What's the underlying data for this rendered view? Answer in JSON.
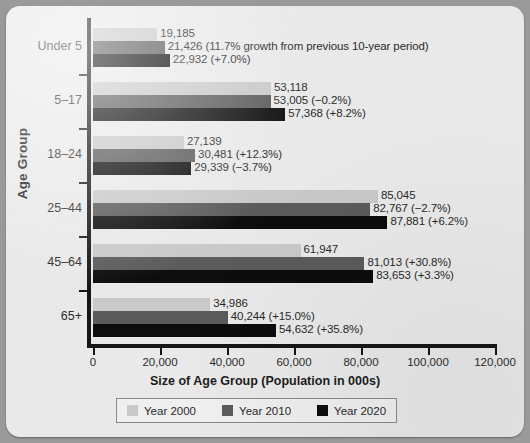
{
  "chart_data": {
    "type": "bar",
    "orientation": "horizontal",
    "title": "",
    "xlabel": "Size of Age Group (Population in 000s)",
    "ylabel": "Age Group",
    "xlim": [
      0,
      120000
    ],
    "xticks": [
      0,
      20000,
      40000,
      60000,
      80000,
      100000,
      120000
    ],
    "xticklabels": [
      "0",
      "20,000",
      "40,000",
      "60,000",
      "80,000",
      "100,000",
      "120,000"
    ],
    "grid": false,
    "legend_position": "bottom",
    "categories": [
      "Under 5",
      "5–17",
      "18–24",
      "25–44",
      "45–64",
      "65+"
    ],
    "series": [
      {
        "name": "Year 2000",
        "color": "#c9c9c9",
        "values": [
          19185,
          53118,
          27139,
          85045,
          61947,
          34986
        ],
        "labels": [
          "19,185",
          "53,118",
          "27,139",
          "85,045",
          "61,947",
          "34,986"
        ]
      },
      {
        "name": "Year 2010",
        "color": "#5b5b5b",
        "values": [
          21426,
          53005,
          30481,
          82767,
          81013,
          40244
        ],
        "labels": [
          "21,426 (11.7% growth from previous 10-year period)",
          "53,005 (−0.2%)",
          "30,481 (+12.3%)",
          "82,767 (−2.7%)",
          "81,013 (+30.8%)",
          "40,244 (+15.0%)"
        ]
      },
      {
        "name": "Year 2020",
        "color": "#0d0d0d",
        "values": [
          22932,
          57368,
          29339,
          87881,
          83653,
          54632
        ],
        "labels": [
          "22,932 (+7.0%)",
          "57,368 (+8.2%)",
          "29,339 (−3.7%)",
          "87,881 (+6.2%)",
          "83,653 (+3.3%)",
          "54,632 (+35.8%)"
        ]
      }
    ]
  },
  "legend": {
    "items": [
      {
        "label": "Year 2000",
        "color": "#c9c9c9"
      },
      {
        "label": "Year 2010",
        "color": "#5b5b5b"
      },
      {
        "label": "Year 2020",
        "color": "#0d0d0d"
      }
    ]
  }
}
